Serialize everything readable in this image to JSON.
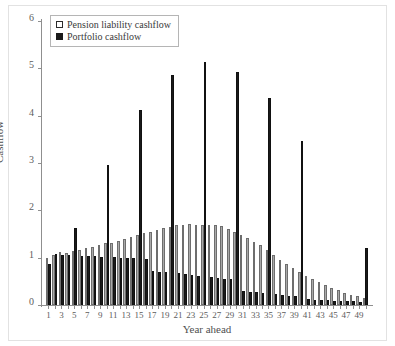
{
  "chart_data": {
    "type": "bar",
    "title": "",
    "xlabel": "Year ahead",
    "ylabel": "Cashflow",
    "ylim": [
      0,
      6
    ],
    "yticks": [
      0,
      1,
      2,
      3,
      4,
      5,
      6
    ],
    "xlim": [
      0,
      51
    ],
    "xticks": [
      1,
      2,
      3,
      4,
      5,
      6,
      7,
      8,
      9,
      10,
      11,
      12,
      13,
      14,
      15,
      16,
      17,
      18,
      19,
      20,
      21,
      22,
      23,
      24,
      25,
      26,
      27,
      28,
      29,
      30,
      31,
      32,
      33,
      34,
      35,
      36,
      37,
      38,
      39,
      40,
      41,
      42,
      43,
      44,
      45,
      46,
      47,
      48,
      49,
      50
    ],
    "xtick_labels_shown": [
      1,
      3,
      5,
      7,
      9,
      11,
      13,
      15,
      17,
      19,
      21,
      23,
      25,
      27,
      29,
      31,
      33,
      35,
      37,
      39,
      41,
      43,
      45,
      47,
      49
    ],
    "grid": false,
    "legend_position": "top-left",
    "categories": [
      1,
      2,
      3,
      4,
      5,
      6,
      7,
      8,
      9,
      10,
      11,
      12,
      13,
      14,
      15,
      16,
      17,
      18,
      19,
      20,
      21,
      22,
      23,
      24,
      25,
      26,
      27,
      28,
      29,
      30,
      31,
      32,
      33,
      34,
      35,
      36,
      37,
      38,
      39,
      40,
      41,
      42,
      43,
      44,
      45,
      46,
      47,
      48,
      49,
      50
    ],
    "series": [
      {
        "name": "Pension liability cashflow",
        "color": "#a9a9a9",
        "values": [
          1.0,
          1.05,
          1.12,
          1.1,
          1.14,
          1.16,
          1.2,
          1.22,
          1.26,
          1.3,
          1.32,
          1.36,
          1.4,
          1.44,
          1.48,
          1.52,
          1.55,
          1.58,
          1.62,
          1.65,
          1.68,
          1.7,
          1.71,
          1.7,
          1.7,
          1.69,
          1.68,
          1.66,
          1.6,
          1.54,
          1.48,
          1.42,
          1.34,
          1.26,
          1.16,
          1.06,
          0.96,
          0.86,
          0.78,
          0.7,
          0.62,
          0.55,
          0.48,
          0.42,
          0.36,
          0.31,
          0.26,
          0.22,
          0.18,
          0.15
        ]
      },
      {
        "name": "Portfolio cashflow",
        "color": "#1a1a1a",
        "values": [
          0.86,
          1.08,
          1.06,
          1.05,
          1.63,
          1.04,
          1.04,
          1.03,
          1.02,
          2.95,
          1.01,
          1.0,
          1.0,
          0.99,
          4.11,
          0.98,
          0.72,
          0.7,
          0.69,
          4.87,
          0.68,
          0.66,
          0.64,
          0.62,
          5.13,
          0.6,
          0.58,
          0.56,
          0.54,
          4.93,
          0.3,
          0.28,
          0.27,
          0.26,
          4.37,
          0.24,
          0.22,
          0.2,
          0.18,
          3.47,
          0.12,
          0.11,
          0.1,
          0.1,
          0.09,
          0.09,
          0.08,
          0.08,
          0.07,
          1.2
        ]
      }
    ]
  },
  "legend": {
    "items": [
      {
        "label": "Pension liability cashflow",
        "marker": "open-square-marker"
      },
      {
        "label": "Portfolio cashflow",
        "marker": "filled-square-marker"
      }
    ]
  }
}
